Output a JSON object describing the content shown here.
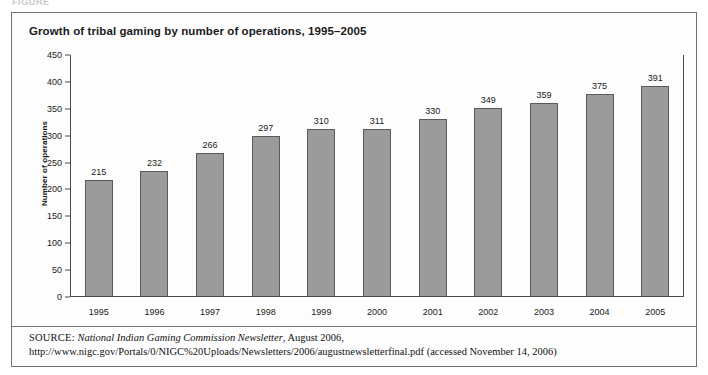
{
  "figure_caption": "FIGURE",
  "title": "Growth of tribal gaming by number of operations, 1995–2005",
  "chart_data": {
    "type": "bar",
    "title": "Growth of tribal gaming by number of operations, 1995–2005",
    "xlabel": "",
    "ylabel": "Number of operations",
    "categories": [
      "1995",
      "1996",
      "1997",
      "1998",
      "1999",
      "2000",
      "2001",
      "2002",
      "2003",
      "2004",
      "2005"
    ],
    "values": [
      215,
      232,
      266,
      297,
      310,
      311,
      330,
      349,
      359,
      375,
      391
    ],
    "ylim": [
      0,
      450
    ],
    "yticks": [
      0,
      50,
      100,
      150,
      200,
      250,
      300,
      350,
      400,
      450
    ],
    "ytick_labels": [
      "0",
      "50",
      "100",
      "150",
      "200",
      "250",
      "300",
      "350",
      "400",
      "450"
    ],
    "grid": false,
    "legend": null,
    "data_labels": true,
    "bar_color": "#9b9b9b",
    "bar_border_color": "#5a5a5a",
    "axis_color": "#4a4a4a",
    "background": "#fdfdfd"
  },
  "source": {
    "kicker": "SOURCE:",
    "publication": "National Indian Gaming Commission Newsletter",
    "rest": ", August 2006, http://www.nigc.gov/Portals/0/NIGC%20Uploads/Newsletters/2006/augustnewsletterfinal.pdf (accessed November 14, 2006)"
  }
}
